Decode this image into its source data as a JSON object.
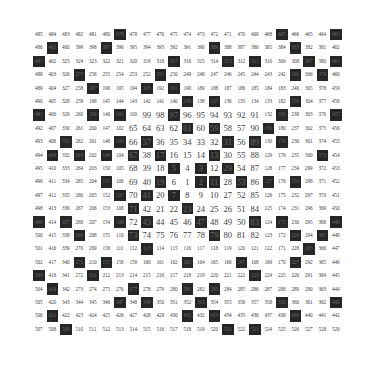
{
  "diagram": {
    "type": "ulam-spiral",
    "size": 23,
    "colors": {
      "background": "#ffffff",
      "prime_cell": "#262626",
      "prime_text": "#6a6a6a",
      "text": "#3c3c3c"
    },
    "rows": [
      [
        485,
        484,
        483,
        482,
        481,
        480,
        479,
        478,
        477,
        476,
        475,
        474,
        473,
        472,
        471,
        470,
        469,
        468,
        467,
        466,
        465,
        464,
        463
      ],
      [
        486,
        401,
        400,
        399,
        398,
        397,
        396,
        395,
        394,
        393,
        392,
        391,
        390,
        389,
        388,
        387,
        386,
        385,
        384,
        383,
        382,
        381,
        462
      ],
      [
        487,
        402,
        325,
        324,
        323,
        322,
        321,
        320,
        319,
        318,
        317,
        316,
        315,
        314,
        313,
        312,
        311,
        310,
        309,
        308,
        307,
        380,
        461
      ],
      [
        488,
        403,
        326,
        257,
        256,
        255,
        254,
        253,
        252,
        251,
        250,
        249,
        248,
        247,
        246,
        245,
        244,
        243,
        242,
        241,
        306,
        379,
        460
      ],
      [
        489,
        404,
        327,
        258,
        197,
        196,
        195,
        194,
        193,
        192,
        191,
        190,
        189,
        188,
        187,
        186,
        185,
        184,
        183,
        240,
        305,
        378,
        459
      ],
      [
        490,
        405,
        328,
        259,
        198,
        145,
        144,
        143,
        142,
        141,
        140,
        139,
        138,
        137,
        136,
        135,
        134,
        133,
        182,
        239,
        304,
        377,
        458
      ],
      [
        491,
        406,
        329,
        260,
        199,
        146,
        101,
        100,
        99,
        98,
        97,
        96,
        95,
        94,
        93,
        92,
        91,
        132,
        181,
        238,
        303,
        376,
        457
      ],
      [
        492,
        407,
        330,
        261,
        200,
        147,
        102,
        65,
        64,
        63,
        62,
        61,
        60,
        59,
        58,
        57,
        90,
        131,
        180,
        237,
        302,
        375,
        456
      ],
      [
        493,
        408,
        331,
        262,
        201,
        148,
        103,
        66,
        37,
        36,
        35,
        34,
        33,
        32,
        31,
        56,
        89,
        130,
        179,
        236,
        301,
        374,
        455
      ],
      [
        494,
        409,
        332,
        263,
        202,
        149,
        104,
        67,
        38,
        17,
        16,
        15,
        14,
        13,
        30,
        55,
        88,
        129,
        178,
        235,
        300,
        373,
        454
      ],
      [
        495,
        410,
        333,
        264,
        203,
        150,
        105,
        68,
        39,
        18,
        5,
        4,
        3,
        12,
        29,
        54,
        87,
        128,
        177,
        234,
        299,
        372,
        453
      ],
      [
        496,
        411,
        334,
        265,
        204,
        151,
        106,
        69,
        40,
        19,
        6,
        1,
        2,
        11,
        28,
        53,
        86,
        127,
        176,
        233,
        298,
        371,
        452
      ],
      [
        497,
        412,
        335,
        266,
        205,
        152,
        107,
        70,
        41,
        20,
        7,
        8,
        9,
        10,
        27,
        52,
        85,
        126,
        175,
        232,
        297,
        370,
        451
      ],
      [
        498,
        413,
        336,
        267,
        206,
        153,
        108,
        71,
        42,
        21,
        22,
        23,
        24,
        25,
        26,
        51,
        84,
        125,
        174,
        231,
        296,
        369,
        450
      ],
      [
        499,
        414,
        337,
        268,
        207,
        154,
        109,
        72,
        43,
        44,
        45,
        46,
        47,
        48,
        49,
        50,
        83,
        124,
        173,
        230,
        295,
        368,
        449
      ],
      [
        500,
        415,
        338,
        269,
        208,
        155,
        110,
        73,
        74,
        75,
        76,
        77,
        78,
        79,
        80,
        81,
        82,
        123,
        172,
        229,
        294,
        367,
        448
      ],
      [
        501,
        416,
        339,
        270,
        209,
        156,
        111,
        112,
        113,
        114,
        115,
        116,
        117,
        118,
        119,
        120,
        121,
        122,
        171,
        228,
        293,
        366,
        447
      ],
      [
        502,
        417,
        340,
        271,
        210,
        157,
        158,
        159,
        160,
        161,
        162,
        163,
        164,
        165,
        166,
        167,
        168,
        169,
        170,
        227,
        292,
        365,
        446
      ],
      [
        503,
        418,
        341,
        272,
        211,
        212,
        213,
        214,
        215,
        216,
        217,
        218,
        219,
        220,
        221,
        222,
        223,
        224,
        225,
        226,
        291,
        364,
        445
      ],
      [
        504,
        419,
        342,
        273,
        274,
        275,
        276,
        277,
        278,
        279,
        280,
        281,
        282,
        283,
        284,
        285,
        286,
        287,
        288,
        289,
        290,
        363,
        444
      ],
      [
        505,
        420,
        343,
        344,
        345,
        346,
        347,
        348,
        349,
        350,
        351,
        352,
        353,
        354,
        355,
        356,
        357,
        358,
        359,
        360,
        361,
        362,
        443
      ],
      [
        506,
        421,
        422,
        423,
        424,
        425,
        426,
        427,
        428,
        429,
        430,
        431,
        432,
        433,
        434,
        435,
        436,
        437,
        438,
        439,
        440,
        441,
        442
      ],
      [
        507,
        508,
        509,
        510,
        511,
        512,
        513,
        514,
        515,
        516,
        517,
        518,
        519,
        520,
        521,
        522,
        523,
        524,
        525,
        526,
        527,
        528,
        529
      ]
    ],
    "highlighted_primes": [
      2,
      3,
      5,
      7,
      11,
      13,
      17,
      19,
      23,
      29,
      31,
      37,
      41,
      43,
      47,
      53,
      59,
      61,
      67,
      71,
      73,
      79,
      83,
      89,
      97,
      101,
      103,
      107,
      109,
      113,
      127,
      131,
      137,
      139,
      149,
      151,
      157,
      163,
      167,
      173,
      179,
      181,
      191,
      193,
      197,
      199,
      211,
      223,
      227,
      229,
      233,
      239,
      241,
      251,
      257,
      263,
      269,
      271,
      277,
      281,
      283,
      293,
      307,
      311,
      313,
      317,
      331,
      337,
      347,
      349,
      353,
      359,
      367,
      373,
      379,
      383,
      389,
      397,
      401,
      409,
      419,
      421,
      431,
      433,
      439,
      443,
      449,
      457,
      461,
      463,
      467,
      479,
      487,
      491,
      499,
      503,
      509,
      521,
      523
    ]
  }
}
